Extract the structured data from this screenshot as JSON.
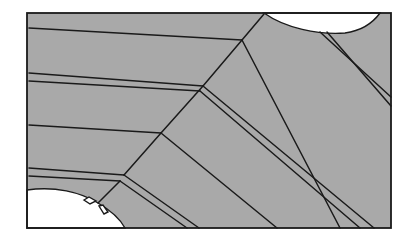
{
  "diagram": {
    "type": "microstructure-schematic",
    "colors": {
      "fill": "#a9a9a9",
      "line": "#1a1a1a",
      "void": "#ffffff"
    },
    "frame": {
      "x": 27,
      "y": 13,
      "width": 364,
      "height": 215
    },
    "voids": [
      {
        "name": "top-void",
        "shape": "half-ellipse",
        "from": [
          264,
          13
        ],
        "to": [
          380,
          13
        ],
        "depth": 20
      },
      {
        "name": "bottom-left-void",
        "shape": "arc-region",
        "from": [
          27,
          190
        ],
        "to": [
          125,
          228
        ]
      }
    ],
    "horizontal_boundaries": [
      {
        "from": [
          29,
          28
        ],
        "to": [
          242,
          40
        ]
      },
      {
        "from": [
          29,
          73
        ],
        "to": [
          203,
          86
        ]
      },
      {
        "from": [
          29,
          81
        ],
        "to": [
          200,
          91
        ]
      },
      {
        "from": [
          29,
          125
        ],
        "to": [
          161,
          133
        ]
      },
      {
        "from": [
          29,
          168
        ],
        "to": [
          124,
          175
        ]
      },
      {
        "from": [
          29,
          176
        ],
        "to": [
          120,
          181
        ]
      }
    ],
    "diagonal_boundaries": [
      {
        "from": [
          264,
          14
        ],
        "to": [
          242,
          40
        ]
      },
      {
        "from": [
          242,
          40
        ],
        "to": [
          203,
          86
        ]
      },
      {
        "from": [
          203,
          86
        ],
        "to": [
          161,
          133
        ]
      },
      {
        "from": [
          161,
          133
        ],
        "to": [
          124,
          175
        ]
      },
      {
        "from": [
          120,
          181
        ],
        "to": [
          98,
          203
        ]
      },
      {
        "from": [
          242,
          40
        ],
        "to": [
          340,
          228
        ]
      },
      {
        "from": [
          203,
          86
        ],
        "to": [
          374,
          228
        ]
      },
      {
        "from": [
          200,
          91
        ],
        "to": [
          360,
          228
        ]
      },
      {
        "from": [
          161,
          133
        ],
        "to": [
          277,
          228
        ]
      },
      {
        "from": [
          124,
          175
        ],
        "to": [
          199,
          228
        ]
      },
      {
        "from": [
          120,
          181
        ],
        "to": [
          187,
          228
        ]
      },
      {
        "from": [
          320,
          32
        ],
        "to": [
          391,
          97
        ]
      },
      {
        "from": [
          327,
          32
        ],
        "to": [
          391,
          106
        ]
      }
    ]
  }
}
